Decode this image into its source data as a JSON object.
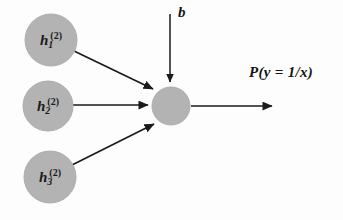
{
  "diagram": {
    "type": "neural-network-output-unit",
    "background_color": "#fdfdfd",
    "node_fill_color": "#b3b3b3",
    "node_stroke_color": "#a8a8a8",
    "arrow_color": "#1a1a1a",
    "text_color": "#141414",
    "input_nodes": [
      {
        "id": "h1",
        "base": "h",
        "subscript": "1",
        "superscript": "(2)",
        "cx": 51,
        "cy": 40,
        "r": 26
      },
      {
        "id": "h2",
        "base": "h",
        "subscript": "2",
        "superscript": "(2)",
        "cx": 48,
        "cy": 106,
        "r": 25
      },
      {
        "id": "h3",
        "base": "h",
        "subscript": "3",
        "superscript": "(2)",
        "cx": 50,
        "cy": 177,
        "r": 26
      }
    ],
    "output_node": {
      "id": "output-unit",
      "cx": 171,
      "cy": 106,
      "r": 19,
      "label": ""
    },
    "bias": {
      "label": "b",
      "label_x": 178,
      "label_y": 4,
      "line_x": 170,
      "line_y_start": 14,
      "line_y_end": 84
    },
    "output": {
      "label": "P(y = 1/x)",
      "label_x": 249,
      "label_y": 64,
      "arrow_x_start": 191,
      "arrow_x_end": 276,
      "arrow_y": 106
    },
    "edges": [
      {
        "from": "h1",
        "to": "output-unit",
        "x1": 74,
        "y1": 51,
        "x2": 156,
        "y2": 91
      },
      {
        "from": "h2",
        "to": "output-unit",
        "x1": 73,
        "y1": 105,
        "x2": 150,
        "y2": 105
      },
      {
        "from": "h3",
        "to": "output-unit",
        "x1": 72,
        "y1": 165,
        "x2": 157,
        "y2": 122
      }
    ]
  }
}
